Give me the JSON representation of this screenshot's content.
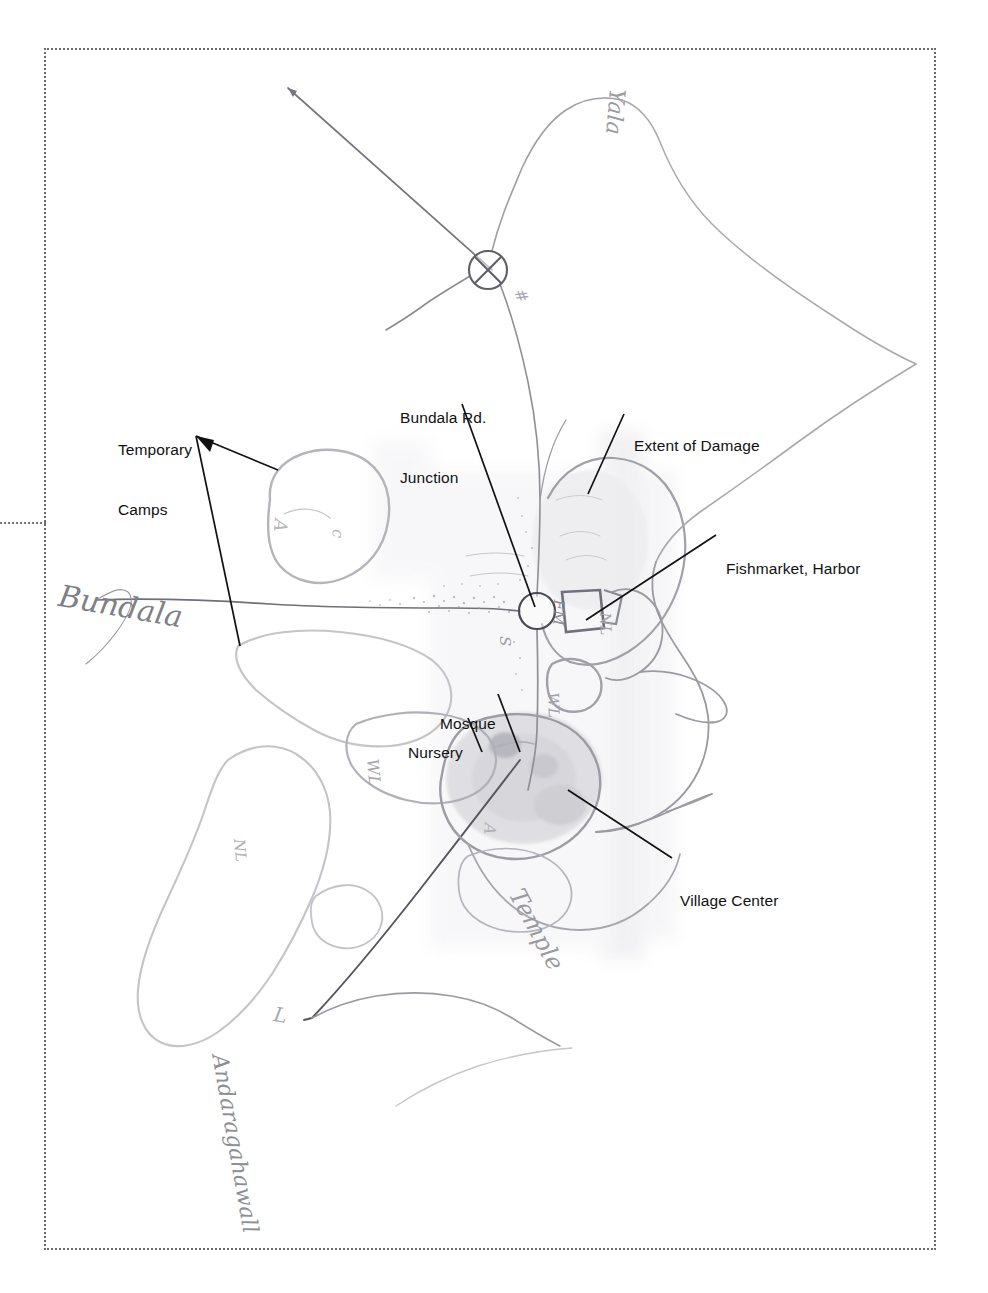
{
  "document": {
    "title": "Annotated Sketch Map — Bundala Tsunami Damage Assessment",
    "kind": "scanned hand-drawn map with printed callout annotations",
    "background_color": "#ffffff",
    "frame": {
      "style": "dotted",
      "color": "#6b6b6b",
      "left": 44,
      "top": 48,
      "width": 892,
      "height": 1202,
      "left_tick_y": 520
    }
  },
  "callouts": [
    {
      "id": "temporary-camps",
      "label": "Temporary\nCamps",
      "line1": "Temporary",
      "line2": "Camps",
      "x": 118,
      "y": 400,
      "leaders": 2
    },
    {
      "id": "bundala-rd-junction",
      "label": "Bundala Rd.\nJunction",
      "line1": "Bundala Rd.",
      "line2": "Junction",
      "x": 400,
      "y": 368,
      "leaders": 1
    },
    {
      "id": "extent-of-damage",
      "label": "Extent of Damage",
      "line1": "Extent of Damage",
      "line2": "",
      "x": 634,
      "y": 398,
      "leaders": 1
    },
    {
      "id": "fishmarket-harbor",
      "label": "Fishmarket, Harbor",
      "line1": "Fishmarket, Harbor",
      "line2": "",
      "x": 726,
      "y": 521,
      "leaders": 1
    },
    {
      "id": "mosque",
      "label": "Mosque",
      "line1": "Mosque",
      "line2": "",
      "x": 440,
      "y": 676,
      "leaders": 1
    },
    {
      "id": "nursery",
      "label": "Nursery",
      "line1": "Nursery",
      "line2": "",
      "x": 408,
      "y": 705,
      "leaders": 1
    },
    {
      "id": "village-center",
      "label": "Village Center",
      "line1": "Village Center",
      "line2": "",
      "x": 680,
      "y": 853,
      "leaders": 1
    }
  ],
  "handwriting": [
    {
      "id": "yala-road-label",
      "text": "Yala",
      "x": 630,
      "y": 90,
      "rotate": 95,
      "size": 22,
      "color": "#9a9aa0"
    },
    {
      "id": "bundala-label",
      "text": "Bundala",
      "x": 62,
      "y": 578,
      "rotate": 10,
      "size": 30,
      "color": "#7f7f86"
    },
    {
      "id": "temple-label",
      "text": "Temple",
      "x": 528,
      "y": 884,
      "rotate": 62,
      "size": 24,
      "color": "#9a9aa0"
    },
    {
      "id": "andaragahawall-label",
      "text": "Andaragahawall",
      "x": 232,
      "y": 1052,
      "rotate": 80,
      "size": 22,
      "color": "#8e8e94"
    },
    {
      "id": "mile-marker-hatch",
      "text": "#",
      "x": 528,
      "y": 286,
      "rotate": 70,
      "size": 16,
      "color": "#a8a8ae"
    },
    {
      "id": "wl-marker-west",
      "text": "WL",
      "x": 382,
      "y": 758,
      "rotate": 85,
      "size": 16,
      "color": "#a5a5ab"
    },
    {
      "id": "nl-marker-southwest",
      "text": "NL",
      "x": 248,
      "y": 838,
      "rotate": 85,
      "size": 15,
      "color": "#b0b0b6"
    },
    {
      "id": "s-marker-junction",
      "text": "S",
      "x": 514,
      "y": 636,
      "rotate": 90,
      "size": 15,
      "color": "#9a9aa0"
    },
    {
      "id": "nl-marker-east",
      "text": "NL",
      "x": 614,
      "y": 612,
      "rotate": 88,
      "size": 15,
      "color": "#a5a5ab"
    },
    {
      "id": "fm-marker",
      "text": "FM",
      "x": 568,
      "y": 600,
      "rotate": 92,
      "size": 15,
      "color": "#8c8c92"
    },
    {
      "id": "wl-marker-pond",
      "text": "WL",
      "x": 562,
      "y": 692,
      "rotate": 88,
      "size": 15,
      "color": "#a0a0a6"
    },
    {
      "id": "l-marker-south",
      "text": "L",
      "x": 276,
      "y": 1002,
      "rotate": 10,
      "size": 20,
      "color": "#a8a8ae"
    },
    {
      "id": "a-marker-camp",
      "text": "A",
      "x": 292,
      "y": 520,
      "rotate": 95,
      "size": 18,
      "color": "#b5b5bb"
    },
    {
      "id": "c-marker-camp",
      "text": "c",
      "x": 348,
      "y": 530,
      "rotate": 95,
      "size": 16,
      "color": "#b5b5bb"
    },
    {
      "id": "a-marker-village",
      "text": "A",
      "x": 500,
      "y": 824,
      "rotate": 95,
      "size": 16,
      "color": "#b0b0b6"
    }
  ],
  "symbols": [
    {
      "id": "junction-crossed-circle-north",
      "x": 488,
      "y": 270,
      "r": 19,
      "kind": "crossed-circle"
    },
    {
      "id": "junction-circle-bundala-rd",
      "x": 537,
      "y": 611,
      "r": 18,
      "kind": "open-circle"
    },
    {
      "id": "fishmarket-box",
      "x": 576,
      "y": 612,
      "w": 34,
      "h": 36,
      "kind": "rect"
    }
  ],
  "colors": {
    "ink_black": "#111111",
    "frame_dot": "#6b6b6b",
    "pencil_dark": "#6f6f76",
    "pencil_mid": "#9a9aa0",
    "pencil_light": "#c2c2c8",
    "wash_gray": "#ececef"
  }
}
